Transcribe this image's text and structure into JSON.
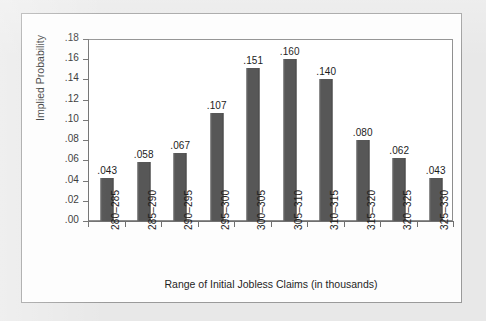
{
  "figure": {
    "background_color": "#e8e8e8",
    "card_color": "#fdfdfd",
    "border_color": "#9a9a9a"
  },
  "chart_data": {
    "type": "bar",
    "title": "",
    "subtitle": "",
    "xlabel": "Range of Initial Jobless Claims (in thousands)",
    "ylabel": "Implied Probability",
    "categories": [
      "280–285",
      "285–290",
      "290–295",
      "295–300",
      "300–305",
      "305–310",
      "310–315",
      "315–320",
      "320–325",
      "325–330"
    ],
    "values": [
      0.043,
      0.058,
      0.067,
      0.107,
      0.151,
      0.16,
      0.14,
      0.08,
      0.062,
      0.043
    ],
    "data_labels": [
      ".043",
      ".058",
      ".067",
      ".107",
      ".151",
      ".160",
      ".140",
      ".080",
      ".062",
      ".043"
    ],
    "ylim": [
      0.0,
      0.18
    ],
    "ytick_values": [
      0.18,
      0.16,
      0.14,
      0.12,
      0.1,
      0.08,
      0.06,
      0.04,
      0.02,
      0.0
    ],
    "ytick_labels": [
      ".18",
      ".16",
      ".14",
      ".12",
      ".10",
      ".08",
      ".06",
      ".04",
      ".02",
      ".00"
    ],
    "grid": false,
    "legend": false,
    "legend_position": "none",
    "bar_color": "#575757",
    "axis_color": "#6f6f6f",
    "label_color": "#1c1c1c"
  }
}
